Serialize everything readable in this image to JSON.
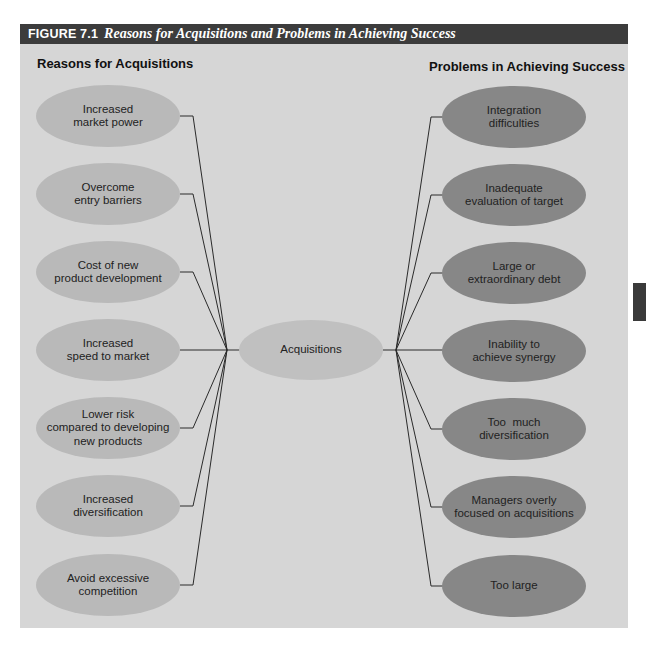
{
  "figure": {
    "number": "FIGURE 7.1",
    "title": "Reasons for Acquisitions and Problems in Achieving Success"
  },
  "left_column": {
    "title": "Reasons for Acquisitions",
    "items": [
      {
        "line1": "Increased",
        "line2": "market power",
        "line3": ""
      },
      {
        "line1": "Overcome",
        "line2": "entry barriers",
        "line3": ""
      },
      {
        "line1": "Cost of new",
        "line2": "product development",
        "line3": ""
      },
      {
        "line1": "Increased",
        "line2": "speed to market",
        "line3": ""
      },
      {
        "line1": "Lower risk",
        "line2": "compared to developing",
        "line3": "new products"
      },
      {
        "line1": "Increased",
        "line2": "diversification",
        "line3": ""
      },
      {
        "line1": "Avoid excessive",
        "line2": "competition",
        "line3": ""
      }
    ]
  },
  "center": {
    "label": "Acquisitions"
  },
  "right_column": {
    "title": "Problems in Achieving Success",
    "items": [
      {
        "line1": "Integration",
        "line2": "difficulties",
        "line3": ""
      },
      {
        "line1": "Inadequate",
        "line2": "evaluation of target",
        "line3": ""
      },
      {
        "line1": "Large or",
        "line2": "extraordinary debt",
        "line3": ""
      },
      {
        "line1": "Inability to",
        "line2": "achieve synergy",
        "line3": ""
      },
      {
        "line1": "Too  much",
        "line2": "diversification",
        "line3": ""
      },
      {
        "line1": "Managers overly",
        "line2": "focused on acquisitions",
        "line3": ""
      },
      {
        "line1": "Too large",
        "line2": "",
        "line3": ""
      }
    ]
  },
  "colors": {
    "header_bg": "#3c3c3c",
    "panel_bg": "#d6d6d6",
    "left_ellipse": "#b9b9b9",
    "center_ellipse": "#c0c0c0",
    "right_ellipse": "#878787",
    "line": "#2a2a2a"
  }
}
